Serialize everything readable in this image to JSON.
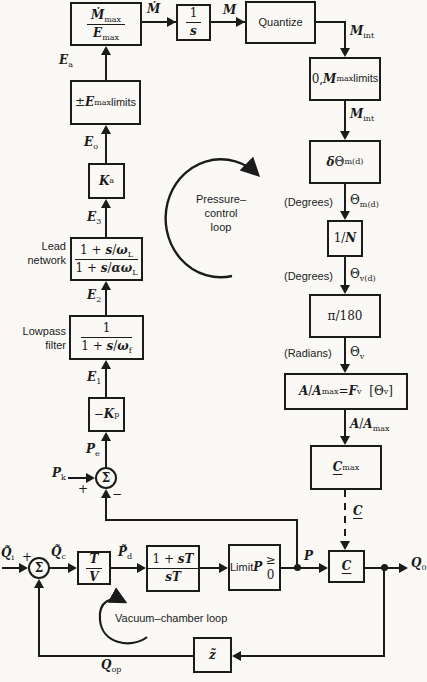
{
  "colors": {
    "ink": "#1b1b1b",
    "paper": "#faf9f6"
  },
  "blocks": {
    "gain_num": "<i>Ṁ</i><sub>max</sub>",
    "gain_den": "<i>E</i><sub>max</sub>",
    "integ_num": "1",
    "integ_den": "<i>s</i>",
    "quantize": "Quantize",
    "mmax_limits": "0, <i>M</i><sub>max</sub><br><span class='sans'>limits</span>",
    "delta_theta": "<i>δ</i>Θ<sub>m(d)</sub>",
    "one_over_n": "1/<i>N</i>",
    "pi180": "π/180",
    "area_fn": "<i>A</i>/<i>A</i><sub>max</sub> = <i>F</i><sub>v</sub>&nbsp; [Θ<sub>v</sub>]",
    "cmax": "<span class='ul'><i>C</i></span><sub>max</sub>",
    "c": "<span class='ul'><i>C</i></span>",
    "pm_emax": "±<i>E</i><sub>max</sub><br><span class='sans'>limits</span>",
    "ka": "<i>K</i><sub>a</sub>",
    "lead_num": "1 + <i>s</i>/<i>ω</i><sub>L</sub>",
    "lead_den": "1 + <i>s</i>/<i>αω</i><sub>L</sub>",
    "lp_num": "1",
    "lp_den": "1 + <i>s</i>/<i>ω</i><sub>f</sub>",
    "kp": "−<i>K</i><sub>p</sub>",
    "tv_num": "<i>T</i>",
    "tv_den": "<i>V</i>",
    "st_num": "1 + <i>sT</i>",
    "st_den": "<i>sT</i>",
    "limit": "<span class='sans'>Limit</span><br><i>P</i> ≥ 0",
    "z": "<i>z̃</i>"
  },
  "labels": {
    "mdot": "<i>Ṁ</i>",
    "m": "<i>M</i>",
    "mint1": "<i>M</i><sub>int</sub>",
    "mint2": "<i>M</i><sub>int</sub>",
    "degrees1": "(Degrees)",
    "theta_md": "Θ<sub>m(d)</sub>",
    "degrees2": "(Degrees)",
    "theta_vd": "Θ<sub>v(d)</sub>",
    "radians": "(Radians)",
    "theta_v": "Θ<sub>v</sub>",
    "a_amax": "<i>A</i>/<i>A</i><sub>max</sub>",
    "c_cmd": "<span class='ul'><i>C</i></span>",
    "ea": "<i>E</i><sub>a</sub>",
    "eo": "<i>E</i><sub>o</sub>",
    "e3": "<i>E</i><sub>3</sub>",
    "e2": "<i>E</i><sub>2</sub>",
    "e1": "<i>E</i><sub>1</sub>",
    "pe": "<i>P</i><sub>e</sub>",
    "pk": "<i>P</i><sub>k</sub>",
    "p": "<i>P</i>",
    "q0": "<i>Q</i><sub>0</sub>",
    "qi": "<i>Q̃</i><sub>i</sub>",
    "qc": "<i>Q̃</i><sub>c</sub>",
    "pd": "<i>P̃</i><sub>d</sub>",
    "qop": "<i>Q</i><sub>op</sub>",
    "plus_p": "+",
    "minus_p": "−",
    "plus_v": "+",
    "sigma": "Σ",
    "lead_side": "Lead<br>network",
    "lowpass_side": "Lowpass<br>filter",
    "pressure_loop": "Pressure–<br>control<br>loop",
    "vacuum_loop": "Vacuum–chamber loop"
  }
}
